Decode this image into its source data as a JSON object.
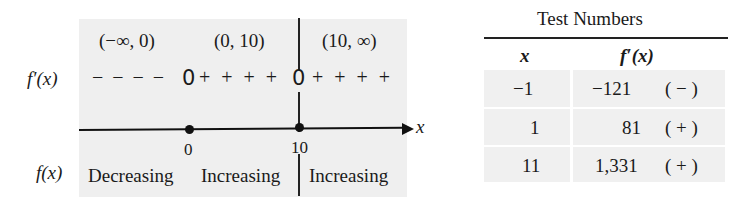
{
  "sign_chart": {
    "intervals": [
      "(−∞, 0)",
      "(0, 10)",
      "(10, ∞)"
    ],
    "derivative_label": "f′(x)",
    "sign_row": {
      "seg1": "− − − −",
      "zero1": "0",
      "seg2": "+ + + +",
      "zero2": "0",
      "seg3": "+ + + +"
    },
    "axis_label": "x",
    "critical_points": [
      "0",
      "10"
    ],
    "function_label": "f(x)",
    "behavior": [
      "Decreasing",
      "Increasing",
      "Increasing"
    ]
  },
  "test_table": {
    "title": "Test Numbers",
    "headers": [
      "x",
      "f′(x)"
    ],
    "rows": [
      {
        "x": "−1",
        "fx": "−121",
        "sign": "( − )"
      },
      {
        "x": "1",
        "fx": "81",
        "sign": "( + )"
      },
      {
        "x": "11",
        "fx": "1,331",
        "sign": "( + )"
      }
    ]
  }
}
